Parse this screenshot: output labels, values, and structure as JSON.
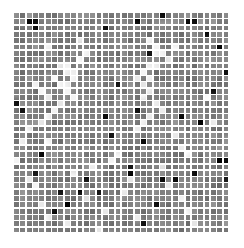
{
  "figure": {
    "background_color": "#ffffff",
    "width": 244,
    "height": 248
  },
  "chart_data": {
    "type": "heatmap",
    "title": "",
    "subtitle": "",
    "xlabel": "",
    "ylabel": "",
    "legend": [],
    "annotations": [],
    "grid": false,
    "axis_visible": false,
    "tick_labels_x": [],
    "tick_labels_y": [],
    "colormap": "grayscale",
    "colormap_min_color": "#ffffff",
    "colormap_mid_color": "#808080",
    "colormap_max_color": "#000000",
    "value_range": [
      0,
      1
    ],
    "rows": 35,
    "cols": 34,
    "cell_pitch_px": 6.35,
    "cell_gap_px": 1.5,
    "plot_left_px": 14,
    "plot_top_px": 13,
    "plot_width_px": 216,
    "plot_height_px": 221,
    "base_value": 0.5,
    "noise_amplitude": 0.06,
    "dark_value": 0.97,
    "light_value": 0.04,
    "dark_cells": [
      [
        0,
        23
      ],
      [
        1,
        2
      ],
      [
        1,
        3
      ],
      [
        1,
        19
      ],
      [
        1,
        27
      ],
      [
        1,
        28
      ],
      [
        2,
        3
      ],
      [
        2,
        14
      ],
      [
        3,
        30
      ],
      [
        5,
        32
      ],
      [
        6,
        21
      ],
      [
        9,
        33
      ],
      [
        11,
        16
      ],
      [
        12,
        31
      ],
      [
        14,
        0
      ],
      [
        15,
        1
      ],
      [
        15,
        19
      ],
      [
        16,
        14
      ],
      [
        16,
        26
      ],
      [
        17,
        29
      ],
      [
        19,
        15
      ],
      [
        20,
        20
      ],
      [
        22,
        4
      ],
      [
        23,
        33
      ],
      [
        23,
        32
      ],
      [
        24,
        18
      ],
      [
        25,
        3
      ],
      [
        25,
        18
      ],
      [
        25,
        28
      ],
      [
        26,
        11
      ],
      [
        26,
        23
      ],
      [
        26,
        25
      ],
      [
        26,
        33
      ],
      [
        28,
        7
      ],
      [
        28,
        10
      ],
      [
        28,
        13
      ],
      [
        30,
        8
      ],
      [
        30,
        22
      ],
      [
        31,
        6
      ],
      [
        33,
        20
      ]
    ],
    "light_cells": [
      [
        4,
        10
      ],
      [
        4,
        21
      ],
      [
        5,
        5
      ],
      [
        5,
        22
      ],
      [
        5,
        25
      ],
      [
        6,
        11
      ],
      [
        6,
        22
      ],
      [
        6,
        23
      ],
      [
        7,
        10
      ],
      [
        7,
        24
      ],
      [
        8,
        7
      ],
      [
        8,
        8
      ],
      [
        8,
        21
      ],
      [
        8,
        22
      ],
      [
        9,
        8
      ],
      [
        9,
        9
      ],
      [
        9,
        20
      ],
      [
        10,
        6
      ],
      [
        10,
        9
      ],
      [
        10,
        19
      ],
      [
        10,
        21
      ],
      [
        11,
        3
      ],
      [
        11,
        7
      ],
      [
        11,
        8
      ],
      [
        11,
        20
      ],
      [
        12,
        4
      ],
      [
        12,
        8
      ],
      [
        12,
        21
      ],
      [
        13,
        5
      ],
      [
        13,
        9
      ],
      [
        13,
        20
      ],
      [
        13,
        30
      ],
      [
        14,
        7
      ],
      [
        14,
        22
      ],
      [
        15,
        6
      ],
      [
        15,
        23
      ],
      [
        16,
        5
      ],
      [
        16,
        21
      ],
      [
        17,
        4
      ],
      [
        17,
        20
      ],
      [
        17,
        31
      ],
      [
        18,
        2
      ],
      [
        18,
        19
      ],
      [
        19,
        25
      ],
      [
        20,
        1
      ],
      [
        20,
        5
      ],
      [
        21,
        26
      ],
      [
        22,
        16
      ],
      [
        22,
        27
      ],
      [
        23,
        0
      ],
      [
        23,
        15
      ],
      [
        24,
        12
      ],
      [
        24,
        23
      ],
      [
        25,
        9
      ],
      [
        26,
        2
      ],
      [
        26,
        18
      ],
      [
        27,
        3
      ],
      [
        27,
        24
      ],
      [
        28,
        17
      ],
      [
        29,
        11
      ],
      [
        29,
        26
      ],
      [
        30,
        4
      ],
      [
        31,
        14
      ],
      [
        31,
        27
      ],
      [
        32,
        5
      ],
      [
        32,
        19
      ],
      [
        33,
        8
      ],
      [
        33,
        28
      ],
      [
        34,
        13
      ]
    ]
  }
}
